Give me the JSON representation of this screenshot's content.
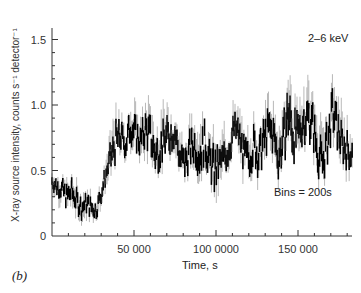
{
  "chart_data": {
    "type": "line",
    "title": "",
    "panel_label": "(b)",
    "xlabel": "Time, s",
    "ylabel": "X-ray source intensity, counts s⁻¹ detector⁻¹",
    "xlim": [
      0,
      183000
    ],
    "ylim": [
      0,
      1.6
    ],
    "x_ticks": [
      {
        "value": 50000,
        "label": "50 000"
      },
      {
        "value": 100000,
        "label": "100 0000"
      },
      {
        "value": 150000,
        "label": "150 000"
      }
    ],
    "x_minor_step": 10000,
    "y_ticks": [
      {
        "value": 0,
        "label": "0"
      },
      {
        "value": 0.5,
        "label": "0.5"
      },
      {
        "value": 1.0,
        "label": "1.0"
      },
      {
        "value": 1.5,
        "label": "1.5"
      }
    ],
    "y_minor_step": 0.1,
    "grid": false,
    "annotations": [
      {
        "text": "2–6 keV",
        "position": "top-right"
      },
      {
        "text": "Bins = 200s",
        "position": "lower-right"
      }
    ],
    "series": [
      {
        "name": "2-6 keV light curve",
        "x": [
          0,
          3000,
          6000,
          9000,
          12000,
          15000,
          18000,
          21000,
          24000,
          27000,
          30000,
          33000,
          36000,
          39000,
          42000,
          45000,
          48000,
          51000,
          54000,
          57000,
          60000,
          63000,
          66000,
          69000,
          72000,
          75000,
          78000,
          81000,
          84000,
          87000,
          90000,
          93000,
          96000,
          99000,
          102000,
          105000,
          108000,
          111000,
          114000,
          117000,
          120000,
          123000,
          126000,
          129000,
          132000,
          135000,
          138000,
          141000,
          144000,
          147000,
          150000,
          153000,
          156000,
          159000,
          162000,
          165000,
          168000,
          171000,
          174000,
          177000,
          180000,
          183000
        ],
        "y": [
          0.42,
          0.38,
          0.36,
          0.3,
          0.34,
          0.27,
          0.22,
          0.25,
          0.22,
          0.2,
          0.33,
          0.48,
          0.6,
          0.72,
          0.76,
          0.7,
          0.85,
          0.78,
          0.72,
          0.82,
          0.76,
          0.62,
          0.68,
          0.74,
          0.78,
          0.8,
          0.6,
          0.55,
          0.66,
          0.7,
          0.62,
          0.72,
          0.58,
          0.5,
          0.55,
          0.6,
          0.68,
          0.82,
          0.78,
          0.62,
          0.58,
          0.7,
          0.6,
          0.72,
          0.82,
          0.78,
          0.6,
          0.72,
          0.95,
          0.78,
          0.75,
          0.88,
          0.92,
          0.85,
          0.65,
          0.55,
          0.72,
          0.95,
          0.82,
          0.7,
          0.66,
          0.62
        ],
        "y_max": [
          0.5,
          0.48,
          0.45,
          0.44,
          0.46,
          0.38,
          0.34,
          0.34,
          0.32,
          0.3,
          0.42,
          0.58,
          0.8,
          0.95,
          0.92,
          0.85,
          1.05,
          0.95,
          0.88,
          1.02,
          1.0,
          0.85,
          0.9,
          0.96,
          0.98,
          0.95,
          0.8,
          0.72,
          0.85,
          0.92,
          0.88,
          0.92,
          0.78,
          0.72,
          0.72,
          0.8,
          0.88,
          0.98,
          0.95,
          0.8,
          0.78,
          0.92,
          0.82,
          0.95,
          1.05,
          1.0,
          0.85,
          0.98,
          1.35,
          1.1,
          1.0,
          1.12,
          1.18,
          1.1,
          0.9,
          0.8,
          0.95,
          1.2,
          1.05,
          0.92,
          0.85,
          0.8
        ],
        "y_min": [
          0.34,
          0.28,
          0.26,
          0.2,
          0.22,
          0.15,
          0.12,
          0.14,
          0.12,
          0.13,
          0.22,
          0.38,
          0.48,
          0.58,
          0.62,
          0.58,
          0.7,
          0.62,
          0.58,
          0.66,
          0.6,
          0.48,
          0.52,
          0.58,
          0.62,
          0.64,
          0.45,
          0.4,
          0.5,
          0.55,
          0.45,
          0.55,
          0.42,
          0.28,
          0.38,
          0.45,
          0.52,
          0.66,
          0.62,
          0.46,
          0.42,
          0.55,
          0.45,
          0.55,
          0.65,
          0.6,
          0.45,
          0.55,
          0.75,
          0.6,
          0.58,
          0.7,
          0.75,
          0.68,
          0.48,
          0.38,
          0.55,
          0.78,
          0.65,
          0.55,
          0.5,
          0.48
        ]
      }
    ]
  }
}
